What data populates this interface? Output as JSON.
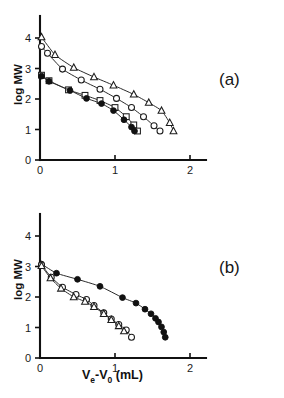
{
  "figure": {
    "xlabel": "Ve-V0 (mL)",
    "ylabel": "log MW",
    "panel_a_label": "(a)",
    "panel_b_label": "(b)"
  },
  "axes": {
    "x_ticks": [
      "0",
      "1",
      "2"
    ],
    "y_ticks": [
      "0",
      "1",
      "2",
      "3",
      "4"
    ]
  },
  "chart_data": [
    {
      "type": "line",
      "title": "(a)",
      "xlabel": "Ve-V0 (mL)",
      "ylabel": "log MW",
      "xlim": [
        0,
        2.45
      ],
      "ylim": [
        0,
        4.55
      ],
      "grid": false,
      "legend": "none",
      "series": [
        {
          "name": "open-triangle",
          "marker": "triangle-open",
          "x": [
            0.02,
            0.2,
            0.45,
            0.72,
            0.98,
            1.25,
            1.45,
            1.62,
            1.73,
            1.78
          ],
          "y": [
            4.03,
            3.45,
            3.03,
            2.72,
            2.45,
            2.15,
            1.88,
            1.62,
            1.22,
            0.95
          ]
        },
        {
          "name": "open-circle",
          "marker": "circle-open",
          "x": [
            0.02,
            0.1,
            0.3,
            0.55,
            0.8,
            1.02,
            1.22,
            1.38,
            1.52,
            1.6
          ],
          "y": [
            3.72,
            3.5,
            2.98,
            2.62,
            2.32,
            2.02,
            1.72,
            1.42,
            1.12,
            0.95
          ]
        },
        {
          "name": "open-square",
          "marker": "square-open",
          "x": [
            0.02,
            0.12,
            0.38,
            0.6,
            0.8,
            1.0,
            1.15,
            1.25,
            1.3
          ],
          "y": [
            2.78,
            2.6,
            2.3,
            2.12,
            1.95,
            1.72,
            1.42,
            1.15,
            0.95
          ]
        },
        {
          "name": "filled-circle",
          "marker": "circle-filled",
          "x": [
            0.02,
            0.12,
            0.4,
            0.62,
            0.82,
            0.98,
            1.12,
            1.22,
            1.26
          ],
          "y": [
            2.75,
            2.58,
            2.28,
            2.02,
            1.85,
            1.62,
            1.32,
            1.08,
            0.95
          ]
        }
      ]
    },
    {
      "type": "line",
      "title": "(b)",
      "xlabel": "Ve-V0 (mL)",
      "ylabel": "log MW",
      "xlim": [
        0,
        2.45
      ],
      "ylim": [
        0,
        4.55
      ],
      "grid": false,
      "legend": "none",
      "series": [
        {
          "name": "filled-circle",
          "marker": "circle-filled",
          "x": [
            0.02,
            0.22,
            0.5,
            0.8,
            1.1,
            1.28,
            1.4,
            1.48,
            1.54,
            1.58,
            1.62,
            1.65,
            1.67
          ],
          "y": [
            3.08,
            2.78,
            2.58,
            2.35,
            1.98,
            1.8,
            1.6,
            1.45,
            1.3,
            1.18,
            1.02,
            0.85,
            0.68
          ]
        },
        {
          "name": "open-circle",
          "marker": "circle-open",
          "x": [
            0.02,
            0.15,
            0.3,
            0.48,
            0.62,
            0.72,
            0.85,
            0.95,
            1.05,
            1.15,
            1.22
          ],
          "y": [
            3.05,
            2.65,
            2.32,
            2.08,
            1.92,
            1.72,
            1.48,
            1.28,
            1.1,
            0.92,
            0.68
          ]
        },
        {
          "name": "open-triangle",
          "marker": "triangle-open",
          "x": [
            0.02,
            0.14,
            0.28,
            0.45,
            0.6,
            0.72,
            0.85,
            0.95,
            1.05,
            1.12
          ],
          "y": [
            3.02,
            2.62,
            2.28,
            2.0,
            1.85,
            1.68,
            1.45,
            1.25,
            1.05,
            0.88
          ]
        }
      ]
    }
  ]
}
